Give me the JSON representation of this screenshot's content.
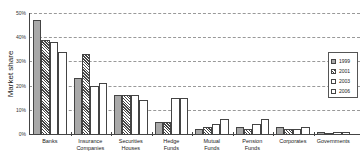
{
  "chart_data": {
    "type": "bar",
    "title": "",
    "xlabel": "",
    "ylabel": "Market share",
    "ylim": [
      0,
      50
    ],
    "yticks": [
      "0%",
      "10%",
      "20%",
      "30%",
      "40%",
      "50%"
    ],
    "grid": true,
    "legend_position": "right",
    "categories": [
      "Banks",
      "Insurance Companies",
      "Securities Houses",
      "Hedge Funds",
      "Mutual Funds",
      "Pension Funds",
      "Corporates",
      "Governments"
    ],
    "category_lines": [
      [
        "Banks"
      ],
      [
        "Insurance",
        "Companies"
      ],
      [
        "Securities",
        "Houses"
      ],
      [
        "Hedge",
        "Funds"
      ],
      [
        "Mutual",
        "Funds"
      ],
      [
        "Pension",
        "Funds"
      ],
      [
        "Corporates"
      ],
      [
        "Governments"
      ]
    ],
    "series": [
      {
        "name": "1999",
        "pattern": "solid-gray",
        "values": [
          47,
          23,
          16,
          5,
          2,
          3,
          3,
          1
        ]
      },
      {
        "name": "2001",
        "pattern": "hatched",
        "values": [
          39,
          33,
          16,
          5,
          3,
          2,
          2,
          0.5
        ]
      },
      {
        "name": "2003",
        "pattern": "white",
        "values": [
          38,
          20,
          16,
          15,
          4,
          4,
          2,
          1
        ]
      },
      {
        "name": "2006",
        "pattern": "dotted",
        "values": [
          34,
          21,
          14,
          15,
          6,
          6,
          3,
          1
        ]
      }
    ]
  }
}
